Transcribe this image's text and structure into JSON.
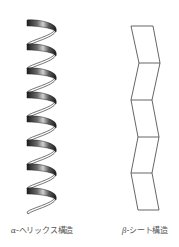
{
  "diagram": {
    "structures": [
      {
        "id": "alpha-helix",
        "greek": "α",
        "label_suffix": "-ヘリックス構造",
        "label": "α-ヘリックス構造",
        "shape": "helix-ribbon",
        "turns": 8
      },
      {
        "id": "beta-sheet",
        "greek": "β",
        "label_suffix": "-シート構造",
        "label": "β-シート構造",
        "shape": "zigzag-pleated-sheet",
        "segments": 5
      }
    ],
    "colors": {
      "helix_dark": "#2a2a2a",
      "helix_light": "#d8d8d8",
      "sheet_stroke": "#555555",
      "label_text": "#555555",
      "background": "#ffffff"
    }
  }
}
